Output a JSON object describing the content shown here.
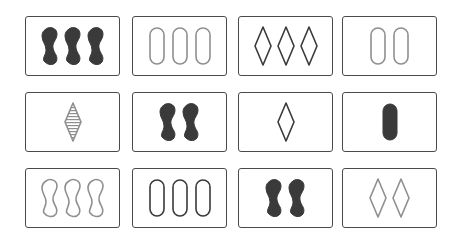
{
  "game": "Set",
  "colors": {
    "dark": "#3a3a3a",
    "gray": "#8f8f8f",
    "border": "#4a4a4a"
  },
  "cards": [
    {
      "row": 0,
      "col": 0,
      "x": 25,
      "y": 16,
      "count": 3,
      "shape": "squiggle",
      "fill": "solid",
      "color": "dark"
    },
    {
      "row": 0,
      "col": 1,
      "x": 132,
      "y": 16,
      "count": 3,
      "shape": "oval",
      "fill": "empty",
      "color": "gray"
    },
    {
      "row": 0,
      "col": 2,
      "x": 238,
      "y": 16,
      "count": 3,
      "shape": "diamond",
      "fill": "empty",
      "color": "dark"
    },
    {
      "row": 0,
      "col": 3,
      "x": 342,
      "y": 16,
      "count": 2,
      "shape": "oval",
      "fill": "empty",
      "color": "gray"
    },
    {
      "row": 1,
      "col": 0,
      "x": 25,
      "y": 92,
      "count": 1,
      "shape": "diamond",
      "fill": "striped",
      "color": "gray"
    },
    {
      "row": 1,
      "col": 1,
      "x": 132,
      "y": 92,
      "count": 2,
      "shape": "squiggle",
      "fill": "solid",
      "color": "dark"
    },
    {
      "row": 1,
      "col": 2,
      "x": 238,
      "y": 92,
      "count": 1,
      "shape": "diamond",
      "fill": "empty",
      "color": "dark"
    },
    {
      "row": 1,
      "col": 3,
      "x": 342,
      "y": 92,
      "count": 1,
      "shape": "oval",
      "fill": "solid",
      "color": "dark"
    },
    {
      "row": 2,
      "col": 0,
      "x": 25,
      "y": 168,
      "count": 3,
      "shape": "squiggle",
      "fill": "empty",
      "color": "gray"
    },
    {
      "row": 2,
      "col": 1,
      "x": 132,
      "y": 168,
      "count": 3,
      "shape": "oval",
      "fill": "empty",
      "color": "dark"
    },
    {
      "row": 2,
      "col": 2,
      "x": 238,
      "y": 168,
      "count": 2,
      "shape": "squiggle",
      "fill": "solid",
      "color": "dark"
    },
    {
      "row": 2,
      "col": 3,
      "x": 342,
      "y": 168,
      "count": 2,
      "shape": "diamond",
      "fill": "empty",
      "color": "gray"
    }
  ]
}
